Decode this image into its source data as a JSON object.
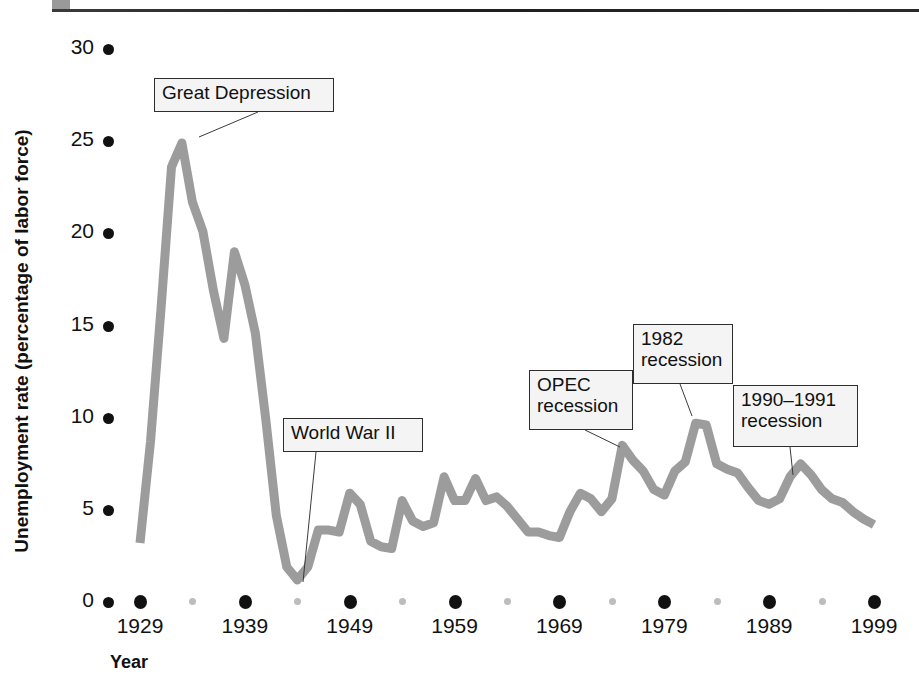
{
  "figure": {
    "top_rule": "rule",
    "corner_mark": "square-mark"
  },
  "axes": {
    "ylabel": "Unemployment rate (percentage of labor force)",
    "xlabel": "Year",
    "yticks": [
      "0",
      "5",
      "10",
      "15",
      "20",
      "25",
      "30"
    ],
    "xticks": [
      "1929",
      "1939",
      "1949",
      "1959",
      "1969",
      "1979",
      "1989",
      "1999"
    ]
  },
  "annotations": [
    {
      "id": "great-depression",
      "text": "Great Depression",
      "x": 154,
      "y": 78,
      "w": 180,
      "h": 34,
      "tipx": 199,
      "tipy": 137,
      "leadx": 258,
      "leady": 112
    },
    {
      "id": "world-war-ii",
      "text": "World War II",
      "x": 283,
      "y": 418,
      "w": 140,
      "h": 34,
      "tipx": 303,
      "tipy": 582,
      "leadx": 316,
      "leady": 452
    },
    {
      "id": "opec-recession",
      "text": "OPEC\nrecession",
      "x": 529,
      "y": 370,
      "w": 104,
      "h": 60,
      "tipx": 620,
      "tipy": 447,
      "leadx": 585,
      "leady": 430
    },
    {
      "id": "recession-1982",
      "text": "1982\nrecession",
      "x": 633,
      "y": 324,
      "w": 100,
      "h": 60,
      "tipx": 692,
      "tipy": 416,
      "leadx": 680,
      "leady": 384
    },
    {
      "id": "recession-1990-1991",
      "text": "1990–1991\nrecession",
      "x": 733,
      "y": 385,
      "w": 125,
      "h": 62,
      "tipx": 793,
      "tipy": 475,
      "leadx": 790,
      "leady": 447
    }
  ],
  "chart_data": {
    "type": "line",
    "title": "",
    "xlabel": "Year",
    "ylabel": "Unemployment rate (percentage of labor force)",
    "xlim": [
      1929,
      1999
    ],
    "ylim": [
      0,
      30
    ],
    "grid": false,
    "legend": "none",
    "line_color": "#9c9c9c",
    "x": [
      1929,
      1930,
      1931,
      1932,
      1933,
      1934,
      1935,
      1936,
      1937,
      1938,
      1939,
      1940,
      1941,
      1942,
      1943,
      1944,
      1945,
      1946,
      1947,
      1948,
      1949,
      1950,
      1951,
      1952,
      1953,
      1954,
      1955,
      1956,
      1957,
      1958,
      1959,
      1960,
      1961,
      1962,
      1963,
      1964,
      1965,
      1966,
      1967,
      1968,
      1969,
      1970,
      1971,
      1972,
      1973,
      1974,
      1975,
      1976,
      1977,
      1978,
      1979,
      1980,
      1981,
      1982,
      1983,
      1984,
      1985,
      1986,
      1987,
      1988,
      1989,
      1990,
      1991,
      1992,
      1993,
      1994,
      1995,
      1996,
      1997,
      1998,
      1999
    ],
    "values": [
      3.2,
      8.7,
      15.9,
      23.6,
      24.9,
      21.7,
      20.1,
      16.9,
      14.3,
      19.0,
      17.2,
      14.6,
      9.9,
      4.7,
      1.9,
      1.2,
      1.9,
      3.9,
      3.9,
      3.8,
      5.9,
      5.3,
      3.3,
      3.0,
      2.9,
      5.5,
      4.4,
      4.1,
      4.3,
      6.8,
      5.5,
      5.5,
      6.7,
      5.5,
      5.7,
      5.2,
      4.5,
      3.8,
      3.8,
      3.6,
      3.5,
      4.9,
      5.9,
      5.6,
      4.9,
      5.6,
      8.5,
      7.7,
      7.1,
      6.1,
      5.8,
      7.1,
      7.6,
      9.7,
      9.6,
      7.5,
      7.2,
      7.0,
      6.2,
      5.5,
      5.3,
      5.6,
      6.8,
      7.5,
      6.9,
      6.1,
      5.6,
      5.4,
      4.9,
      4.5,
      4.2
    ],
    "annotations": [
      {
        "label": "Great Depression",
        "year": 1933,
        "value": 24.9
      },
      {
        "label": "World War II",
        "year": 1944,
        "value": 1.2
      },
      {
        "label": "OPEC recession",
        "year": 1975,
        "value": 8.5
      },
      {
        "label": "1982 recession",
        "year": 1982,
        "value": 9.7
      },
      {
        "label": "1990-1991 recession",
        "year": 1992,
        "value": 7.5
      }
    ]
  }
}
